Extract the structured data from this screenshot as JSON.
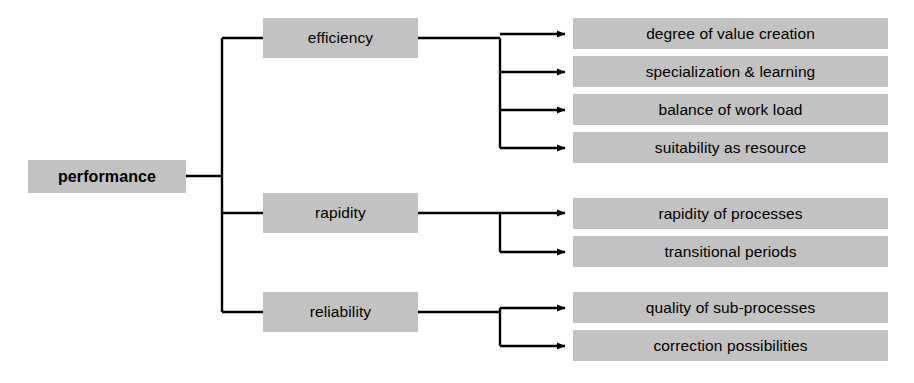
{
  "diagram": {
    "type": "hierarchy-tree",
    "orientation": "left-to-right",
    "colors": {
      "node_fill": "#c2c2c2",
      "node_text": "#000000",
      "connector": "#000000",
      "background": "#ffffff"
    },
    "root": {
      "label": "performance"
    },
    "branches": [
      {
        "label": "efficiency",
        "leaves": [
          {
            "label": "degree of value creation"
          },
          {
            "label": "specialization & learning"
          },
          {
            "label": "balance of work load"
          },
          {
            "label": "suitability as resource"
          }
        ]
      },
      {
        "label": "rapidity",
        "leaves": [
          {
            "label": "rapidity of processes"
          },
          {
            "label": "transitional periods"
          }
        ]
      },
      {
        "label": "reliability",
        "leaves": [
          {
            "label": "quality of sub-processes"
          },
          {
            "label": "correction possibilities"
          }
        ]
      }
    ]
  }
}
